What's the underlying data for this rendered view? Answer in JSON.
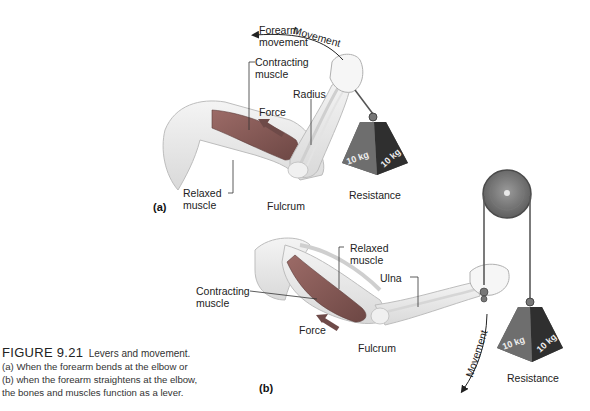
{
  "caption": {
    "figure_number": "FIGURE 9.21",
    "title": "Levers and movement.",
    "lines": [
      "(a) When the forearm bends at the elbow or",
      "(b) when the forearm straightens at the elbow,",
      "the bones and muscles function as a lever."
    ]
  },
  "panel_a": {
    "panel_label": "(a)",
    "labels": {
      "forearm_movement_1": "Forearm",
      "forearm_movement_2": "movement",
      "movement": "Movement",
      "contracting_muscle_1": "Contracting",
      "contracting_muscle_2": "muscle",
      "radius": "Radius",
      "force": "Force",
      "relaxed_muscle_1": "Relaxed",
      "relaxed_muscle_2": "muscle",
      "fulcrum": "Fulcrum",
      "resistance": "Resistance"
    },
    "weight": {
      "left_face": "10 kg",
      "right_face": "10 kg"
    }
  },
  "panel_b": {
    "panel_label": "(b)",
    "labels": {
      "relaxed_muscle_1": "Relaxed",
      "relaxed_muscle_2": "muscle",
      "ulna": "Ulna",
      "contracting_muscle_1": "Contracting",
      "contracting_muscle_2": "muscle",
      "force": "Force",
      "fulcrum": "Fulcrum",
      "movement": "Movement",
      "resistance": "Resistance"
    },
    "weight": {
      "left_face": "10 kg",
      "right_face": "10 kg"
    }
  },
  "colors": {
    "background": "#ffffff",
    "muscle": "#8a5a56",
    "force_arrow": "#6e4a48",
    "weight_light": "#6b6b6b",
    "weight_dark": "#2f2f2f",
    "bone": "#efefef",
    "skin_outline": "#b8b8b8"
  }
}
